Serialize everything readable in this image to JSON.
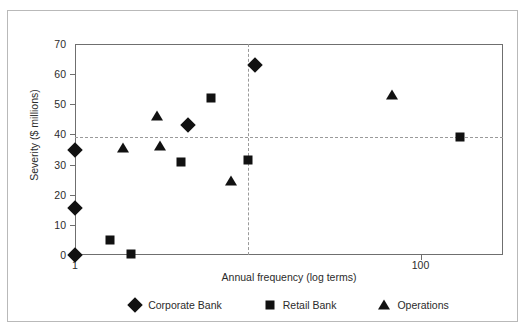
{
  "chart_data": {
    "type": "scatter",
    "title": "",
    "xlabel": "Annual frequency (log terms)",
    "ylabel": "Severity ($ millions)",
    "xscale": "log",
    "xlim": [
      1,
      300
    ],
    "ylim": [
      0,
      70
    ],
    "xticks": [
      1,
      100
    ],
    "xtick_labels": [
      "1",
      "100"
    ],
    "yticks": [
      0,
      10,
      20,
      30,
      40,
      50,
      60,
      70
    ],
    "ytick_labels": [
      "0",
      "10",
      "20",
      "30",
      "40",
      "50",
      "60",
      "70"
    ],
    "grid": false,
    "legend_position": "bottom",
    "reference_lines": {
      "horizontal_y": 39,
      "vertical_x": 10
    },
    "series": [
      {
        "name": "Corporate Bank",
        "marker": "diamond",
        "color": "#111111",
        "points": [
          {
            "x": 1,
            "y": 0
          },
          {
            "x": 1,
            "y": 15.5
          },
          {
            "x": 1,
            "y": 35
          },
          {
            "x": 4.5,
            "y": 43
          },
          {
            "x": 11,
            "y": 63
          }
        ]
      },
      {
        "name": "Retail Bank",
        "marker": "square",
        "color": "#111111",
        "points": [
          {
            "x": 1.6,
            "y": 5
          },
          {
            "x": 2.1,
            "y": 0.3
          },
          {
            "x": 4.1,
            "y": 31
          },
          {
            "x": 6.1,
            "y": 52
          },
          {
            "x": 10,
            "y": 31.5
          },
          {
            "x": 170,
            "y": 39
          }
        ]
      },
      {
        "name": "Operations",
        "marker": "triangle",
        "color": "#111111",
        "points": [
          {
            "x": 1.9,
            "y": 35.5
          },
          {
            "x": 3.1,
            "y": 36
          },
          {
            "x": 3.0,
            "y": 46
          },
          {
            "x": 8.0,
            "y": 24.5
          },
          {
            "x": 68,
            "y": 53
          }
        ]
      }
    ]
  },
  "legend": {
    "items": [
      {
        "label": "Corporate Bank",
        "marker": "diamond"
      },
      {
        "label": "Retail Bank",
        "marker": "square"
      },
      {
        "label": "Operations",
        "marker": "triangle"
      }
    ]
  }
}
